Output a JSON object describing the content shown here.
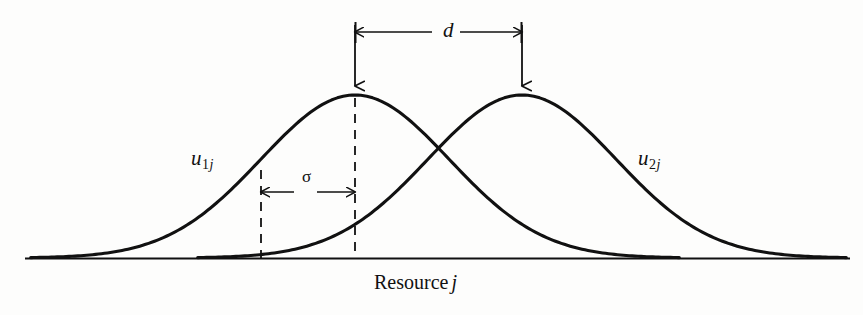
{
  "figure": {
    "kind": "niche-overlap-diagram",
    "background_color": "#fdfdfc",
    "ink_color": "#111111",
    "axis_label": "Resource",
    "axis_label_symbol": "j",
    "curve1": {
      "base": "u",
      "subscript": "1",
      "subscript_j": "j"
    },
    "curve2": {
      "base": "u",
      "subscript": "2",
      "subscript_j": "j"
    },
    "separation_label": "d",
    "sigma_label": "σ"
  },
  "chart_data": {
    "type": "line",
    "title": "",
    "subtitle": "",
    "xlabel": "Resource j",
    "ylabel": "",
    "grid": false,
    "legend_position": "inline-on-curves",
    "axis": {
      "x_axis_drawn": true,
      "y_axis_drawn": false,
      "baseline_y_px": 258,
      "x_start_px": 25,
      "x_end_px": 850
    },
    "series": [
      {
        "name": "u1j",
        "label": "u₁ⱼ",
        "curve": "gaussian",
        "mean_px": 355,
        "sigma_px": 94,
        "peak_y_px": 95,
        "amplitude_px": 163,
        "color": "#111111",
        "label_position": {
          "x_px": 191,
          "y_px": 148
        }
      },
      {
        "name": "u2j",
        "label": "u₂ⱼ",
        "curve": "gaussian",
        "mean_px": 522,
        "sigma_px": 94,
        "peak_y_px": 95,
        "amplitude_px": 163,
        "color": "#111111",
        "label_position": {
          "x_px": 638,
          "y_px": 148
        }
      }
    ],
    "intersection_px": {
      "x": 439,
      "y": 155
    },
    "annotations": [
      {
        "id": "d-measure",
        "text": "d",
        "type": "double-headed-arrow",
        "orientation": "horizontal",
        "y_px": 32,
        "x_from_px": 355,
        "x_to_px": 522,
        "meaning": "distance between the two utilization curve peaks"
      },
      {
        "id": "sigma-measure",
        "text": "σ",
        "type": "double-headed-arrow",
        "orientation": "horizontal",
        "y_px": 192,
        "x_from_px": 261,
        "x_to_px": 355,
        "meaning": "standard deviation (niche width) of a utilization curve"
      },
      {
        "id": "peak1-pointer",
        "type": "down-arrow",
        "x_px": 355,
        "y_from_px": 25,
        "y_to_px": 95
      },
      {
        "id": "peak2-pointer",
        "type": "down-arrow",
        "x_px": 522,
        "y_from_px": 25,
        "y_to_px": 95
      },
      {
        "id": "peak1-dropline",
        "type": "dashed-vertical",
        "x_px": 355,
        "y_from_px": 97,
        "y_to_px": 258
      },
      {
        "id": "sigma-left-dropline",
        "type": "dashed-vertical",
        "x_px": 261,
        "y_from_px": 170,
        "y_to_px": 258
      }
    ]
  }
}
